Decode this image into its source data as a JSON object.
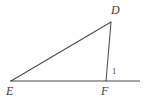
{
  "figure": {
    "kind": "geometry-diagram",
    "background_color": "#ffffff",
    "stroke_color": "#4a4a4a",
    "label_color": "#3a3a3a",
    "stroke_width": "1",
    "canvas": {
      "width": 145,
      "height": 104
    },
    "points": {
      "D": {
        "x": 111,
        "y": 22
      },
      "E": {
        "x": 11,
        "y": 81
      },
      "F": {
        "x": 106,
        "y": 81
      },
      "line_left_end": {
        "x": 10,
        "y": 81
      },
      "line_right_end": {
        "x": 140,
        "y": 81
      }
    },
    "segments": [
      {
        "name": "segment-ED",
        "from": "E",
        "to": "D"
      },
      {
        "name": "segment-DF",
        "from": "D",
        "to": "F"
      },
      {
        "name": "baseline-through-E-F",
        "from": "line_left_end",
        "to": "line_right_end"
      }
    ],
    "labels": {
      "D": "D",
      "E": "E",
      "F": "F",
      "angle_1": "1"
    }
  }
}
